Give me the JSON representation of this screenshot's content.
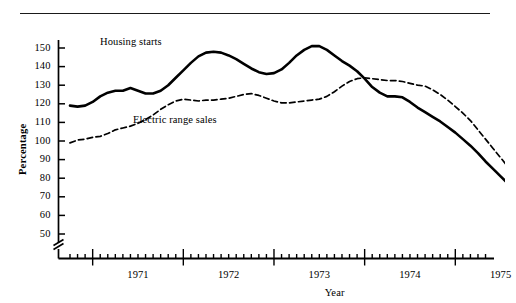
{
  "figure": {
    "top_rule": true,
    "axis_break": true,
    "background": "#ffffff",
    "line_color": "#000000"
  },
  "axis_titles": {
    "y": "Percentage",
    "x": "Year"
  },
  "series_labels": {
    "solid": "Housing starts",
    "dashed": "Electric range sales"
  },
  "chart_data": {
    "type": "line",
    "title": "",
    "xlabel": "Year",
    "ylabel": "Percentage",
    "ylim": [
      50,
      155
    ],
    "yticks": [
      50,
      60,
      70,
      80,
      90,
      100,
      110,
      120,
      130,
      140,
      150
    ],
    "ytick_labels": [
      "50",
      "60",
      "70",
      "80",
      "90",
      "100",
      "110",
      "120",
      "130",
      "140",
      "150"
    ],
    "xlim": [
      "1970-10",
      "1975-10"
    ],
    "xtick_labels": [
      "1971",
      "1972",
      "1973",
      "1974",
      "1975"
    ],
    "x_major_ticks": [
      "1971-01",
      "1972-01",
      "1973-01",
      "1974-01",
      "1975-01"
    ],
    "x_minor_tick_interval": "1 month",
    "grid": false,
    "legend": "inline-annotations",
    "axis_break_below": 50,
    "x": [
      "1970-10",
      "1970-11",
      "1970-12",
      "1971-01",
      "1971-02",
      "1971-03",
      "1971-04",
      "1971-05",
      "1971-06",
      "1971-07",
      "1971-08",
      "1971-09",
      "1971-10",
      "1971-11",
      "1971-12",
      "1972-01",
      "1972-02",
      "1972-03",
      "1972-04",
      "1972-05",
      "1972-06",
      "1972-07",
      "1972-08",
      "1972-09",
      "1972-10",
      "1972-11",
      "1972-12",
      "1973-01",
      "1973-02",
      "1973-03",
      "1973-04",
      "1973-05",
      "1973-06",
      "1973-07",
      "1973-08",
      "1973-09",
      "1973-10",
      "1973-11",
      "1973-12",
      "1974-01",
      "1974-02",
      "1974-03",
      "1974-04",
      "1974-05",
      "1974-06",
      "1974-07",
      "1974-08",
      "1974-09",
      "1974-10",
      "1974-11",
      "1974-12",
      "1975-01",
      "1975-02",
      "1975-03",
      "1975-04",
      "1975-05",
      "1975-06",
      "1975-07",
      "1975-08",
      "1975-09",
      "1975-10"
    ],
    "series": [
      {
        "name": "Housing starts",
        "style": "solid",
        "linewidth": 2.6,
        "values": [
          119,
          118.5,
          119,
          121,
          124,
          126,
          127,
          127,
          128.5,
          127,
          125.5,
          125.5,
          127,
          130,
          134,
          138,
          142,
          145.5,
          147.5,
          148,
          147.5,
          146,
          144,
          141.5,
          139,
          137,
          136,
          136.5,
          138.5,
          142,
          146,
          149,
          151,
          151,
          149,
          146,
          143,
          140.5,
          137.5,
          133.5,
          129,
          126,
          124,
          124,
          123.5,
          121,
          118,
          115.5,
          113,
          110.5,
          107.5,
          104.5,
          101,
          97.5,
          93.5,
          89,
          85,
          81,
          77,
          75,
          75.5
        ]
      },
      {
        "name": "Electric range sales",
        "style": "dashed",
        "linewidth": 1.7,
        "values": [
          99,
          100.5,
          101,
          102,
          102.5,
          104,
          106,
          107,
          108,
          109.5,
          111.5,
          114,
          117,
          119.5,
          121.5,
          122.5,
          122,
          121.5,
          122,
          122,
          122.5,
          123,
          124,
          125,
          125.5,
          124.5,
          123,
          121.5,
          120.5,
          120.5,
          121,
          121.5,
          122,
          122.5,
          124,
          126.5,
          129.5,
          132,
          133.5,
          134,
          133.5,
          133,
          132.5,
          132.5,
          132,
          131,
          130,
          129.5,
          127.5,
          125,
          122,
          118.5,
          115,
          111,
          106,
          101,
          96,
          91,
          86,
          83.5,
          83
        ]
      }
    ]
  }
}
